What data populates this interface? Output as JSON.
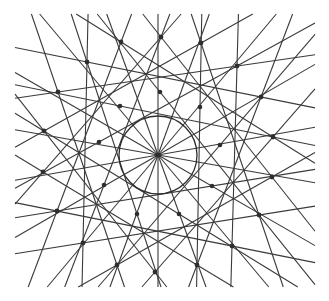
{
  "diagram": {
    "stroke_color": "#3a3a3a",
    "dot_color": "#2e2e2e",
    "background": "#ffffff",
    "center_point": {
      "label": "center"
    },
    "outer_points_count": 18,
    "inner_points_count": 9,
    "radial_lines_count": 18
  }
}
